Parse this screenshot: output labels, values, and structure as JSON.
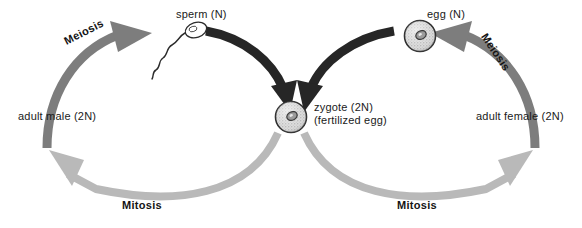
{
  "diagram": {
    "background_color": "#ffffff",
    "colors": {
      "meiosis_arrow": "#7d7d7d",
      "fertilization_arrow": "#262626",
      "mitosis_arrow": "#b9b9b9",
      "text": "#1a1a1a",
      "cell_fill": "#d8d8d8",
      "cell_outline": "#2b2b2b",
      "nucleus": "#3a3a3a"
    },
    "labels": {
      "sperm": "sperm (N)",
      "egg": "egg (N)",
      "adult_male": "adult male (2N)",
      "adult_female": "adult female (2N)",
      "zygote_line1": "zygote (2N)",
      "zygote_line2": "(fertilized egg)",
      "meiosis_left": "Meiosis",
      "meiosis_right": "Meiosis",
      "mitosis_left": "Mitosis",
      "mitosis_right": "Mitosis"
    },
    "nodes": [
      {
        "id": "adult-male",
        "label": "adult male (2N)",
        "ploidy": "2N",
        "x": 62,
        "y": 116
      },
      {
        "id": "sperm",
        "label": "sperm (N)",
        "ploidy": "N",
        "x": 175,
        "y": 38
      },
      {
        "id": "zygote",
        "label": "zygote (2N)",
        "ploidy": "2N",
        "x": 291,
        "y": 117
      },
      {
        "id": "egg",
        "label": "egg (N)",
        "ploidy": "N",
        "x": 420,
        "y": 36
      },
      {
        "id": "adult-female",
        "label": "adult female (2N)",
        "ploidy": "2N",
        "x": 521,
        "y": 116
      }
    ],
    "arrows": [
      {
        "id": "meiosis-left",
        "process": "Meiosis",
        "from": "adult male (2N)",
        "to": "sperm (N)",
        "color": "#7d7d7d"
      },
      {
        "id": "fertilization-left",
        "process": "Fertilization",
        "from": "sperm (N)",
        "to": "zygote (2N)",
        "color": "#262626"
      },
      {
        "id": "meiosis-right",
        "process": "Meiosis",
        "from": "adult female (2N)",
        "to": "egg (N)",
        "color": "#7d7d7d"
      },
      {
        "id": "fertilization-right",
        "process": "Fertilization",
        "from": "egg (N)",
        "to": "zygote (2N)",
        "color": "#262626"
      },
      {
        "id": "mitosis-left",
        "process": "Mitosis",
        "from": "zygote (2N)",
        "to": "adult male (2N)",
        "color": "#b9b9b9"
      },
      {
        "id": "mitosis-right",
        "process": "Mitosis",
        "from": "zygote (2N)",
        "to": "adult female (2N)",
        "color": "#b9b9b9"
      }
    ]
  }
}
